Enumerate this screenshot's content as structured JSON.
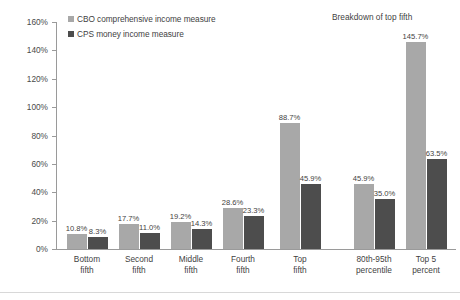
{
  "chart_data": {
    "type": "bar",
    "title": "",
    "section_title": "Breakdown of top fifth",
    "xlabel": "",
    "ylabel": "",
    "ylim": [
      0,
      160
    ],
    "ytick_labels": [
      "0%",
      "20%",
      "40%",
      "60%",
      "80%",
      "100%",
      "120%",
      "140%",
      "160%"
    ],
    "ytick_values": [
      0,
      20,
      40,
      60,
      80,
      100,
      120,
      140,
      160
    ],
    "grid": false,
    "legend_position": "top-left",
    "categories": [
      "Bottom fifth",
      "Second fifth",
      "Middle fifth",
      "Fourth fifth",
      "Top fifth",
      "80th-95th percentile",
      "Top 5 percent"
    ],
    "category_lines": [
      [
        "Bottom",
        "fifth"
      ],
      [
        "Second",
        "fifth"
      ],
      [
        "Middle",
        "fifth"
      ],
      [
        "Fourth",
        "fifth"
      ],
      [
        "Top",
        "fifth"
      ],
      [
        "80th-95th",
        "percentile"
      ],
      [
        "Top 5",
        "percent"
      ]
    ],
    "series": [
      {
        "name": "CBO comprehensive income measure",
        "color": "#a8a8a8",
        "values": [
          10.8,
          17.7,
          19.2,
          28.6,
          88.7,
          45.9,
          145.7
        ],
        "value_labels": [
          "10.8%",
          "17.7%",
          "19.2%",
          "28.6%",
          "88.7%",
          "45.9%",
          "145.7%"
        ]
      },
      {
        "name": "CPS money income measure",
        "color": "#4d4d4d",
        "values": [
          8.3,
          11.0,
          14.3,
          23.3,
          45.9,
          35.0,
          63.5
        ],
        "value_labels": [
          "8.3%",
          "11.0%",
          "14.3%",
          "23.3%",
          "45.9%",
          "35.0%",
          "63.5%"
        ]
      }
    ]
  },
  "legend": {
    "items": [
      {
        "label": "CBO comprehensive income measure",
        "color": "#a8a8a8"
      },
      {
        "label": "CPS money income measure",
        "color": "#4d4d4d"
      }
    ]
  }
}
